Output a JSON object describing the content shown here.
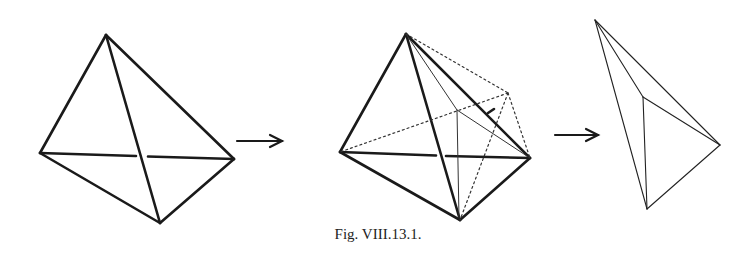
{
  "figure": {
    "caption": "Fig. VIII.13.1.",
    "ink_color": "#1a1a1a",
    "panels": [
      {
        "name": "tetrahedron",
        "vertices": {
          "top": [
            106,
            35
          ],
          "left": [
            40,
            153
          ],
          "right": [
            234,
            159
          ],
          "bottom": [
            160,
            223
          ]
        },
        "edges": [
          [
            "top",
            "left"
          ],
          [
            "top",
            "right"
          ],
          [
            "top",
            "bottom"
          ],
          [
            "left",
            "right"
          ],
          [
            "left",
            "bottom"
          ],
          [
            "right",
            "bottom"
          ]
        ]
      },
      {
        "name": "tetrahedron-with-construction",
        "vertices": {
          "top": [
            406,
            34
          ],
          "left": [
            340,
            152
          ],
          "right": [
            530,
            158
          ],
          "bottom": [
            460,
            220
          ],
          "inner": [
            457,
            110
          ],
          "outer": [
            508,
            93
          ]
        },
        "solid_edges": [
          [
            "top",
            "left"
          ],
          [
            "top",
            "right"
          ],
          [
            "top",
            "bottom"
          ],
          [
            "left",
            "right"
          ],
          [
            "left",
            "bottom"
          ],
          [
            "right",
            "bottom"
          ]
        ],
        "thin_edges": [
          [
            "top",
            "inner"
          ],
          [
            "inner",
            "right"
          ],
          [
            "inner",
            "bottom"
          ]
        ],
        "dotted_edges": [
          [
            "top",
            "outer"
          ],
          [
            "outer",
            "right"
          ],
          [
            "outer",
            "left"
          ],
          [
            "outer",
            "bottom"
          ]
        ]
      },
      {
        "name": "resulting-solid",
        "vertices": {
          "top": [
            595,
            20
          ],
          "inner": [
            643,
            97
          ],
          "right": [
            720,
            145
          ],
          "bottom": [
            647,
            209
          ]
        },
        "edges": [
          [
            "top",
            "inner"
          ],
          [
            "top",
            "right"
          ],
          [
            "top",
            "bottom"
          ],
          [
            "inner",
            "right"
          ],
          [
            "inner",
            "bottom"
          ],
          [
            "right",
            "bottom"
          ]
        ]
      }
    ],
    "arrows": [
      {
        "from": [
          237,
          141
        ],
        "to": [
          282,
          141
        ]
      },
      {
        "from": [
          555,
          135
        ],
        "to": [
          598,
          135
        ]
      }
    ]
  }
}
